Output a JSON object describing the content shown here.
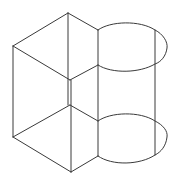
{
  "diagram": {
    "line_color": "#3a3a3a",
    "background": "#ffffff",
    "parts": [
      {
        "name": "prism",
        "label": ""
      },
      {
        "name": "half-cylinder",
        "label": ""
      }
    ]
  }
}
